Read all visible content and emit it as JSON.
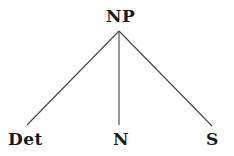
{
  "tree": {
    "root": {
      "label": "NP",
      "x": 119,
      "y": 31
    },
    "children": [
      {
        "label": "Det",
        "x": 27,
        "y": 125
      },
      {
        "label": "N",
        "x": 119,
        "y": 125
      },
      {
        "label": "S",
        "x": 212,
        "y": 126
      }
    ]
  },
  "colors": {
    "line": "#444444",
    "text": "#1a1a1a",
    "background": "#ffffff"
  }
}
